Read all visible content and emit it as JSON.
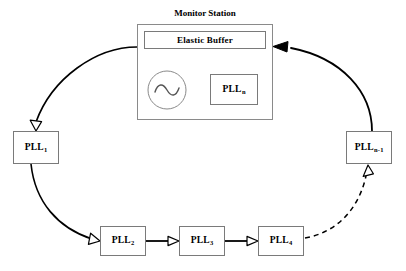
{
  "diagram": {
    "title": "Monitor Station",
    "colors": {
      "background": "#ffffff",
      "stroke": "#000000",
      "box_border": "#7a7a7a",
      "text": "#000000"
    },
    "station": {
      "title": "Monitor Station",
      "elastic_buffer": {
        "label": "Elastic Buffer"
      },
      "oscillator": {
        "label": "oscillator-symbol"
      },
      "pll_n": {
        "label": "PLL",
        "subscript": "n"
      }
    },
    "nodes": [
      {
        "id": "pll-1",
        "label": "PLL",
        "subscript": "1"
      },
      {
        "id": "pll-2",
        "label": "PLL",
        "subscript": "2"
      },
      {
        "id": "pll-3",
        "label": "PLL",
        "subscript": "3"
      },
      {
        "id": "pll-4",
        "label": "PLL",
        "subscript": "4"
      },
      {
        "id": "pll-n-1",
        "label": "PLL",
        "subscript": "n-1"
      }
    ],
    "edges": [
      {
        "id": "station-to-pll1",
        "from": "monitor-station",
        "to": "pll-1",
        "style": "solid",
        "arrowhead": "hollow"
      },
      {
        "id": "pll1-to-pll2",
        "from": "pll-1",
        "to": "pll-2",
        "style": "solid",
        "arrowhead": "hollow"
      },
      {
        "id": "pll2-to-pll3",
        "from": "pll-2",
        "to": "pll-3",
        "style": "solid",
        "arrowhead": "hollow"
      },
      {
        "id": "pll3-to-pll4",
        "from": "pll-3",
        "to": "pll-4",
        "style": "solid",
        "arrowhead": "hollow"
      },
      {
        "id": "pll4-to-plln1",
        "from": "pll-4",
        "to": "pll-n-1",
        "style": "dashed",
        "arrowhead": "hollow"
      },
      {
        "id": "plln1-to-station",
        "from": "pll-n-1",
        "to": "monitor-station",
        "style": "solid",
        "arrowhead": "filled"
      },
      {
        "id": "osc-to-buffer",
        "from": "oscillator",
        "to": "elastic-buffer",
        "style": "solid",
        "arrowhead": "hollow"
      },
      {
        "id": "plln-to-buffer",
        "from": "pll-n",
        "to": "elastic-buffer",
        "style": "solid",
        "arrowhead": "hollow"
      }
    ]
  }
}
